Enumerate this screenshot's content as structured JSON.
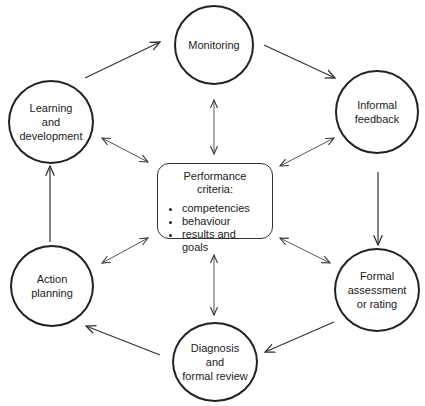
{
  "diagram": {
    "center": {
      "title": "Performance criteria:",
      "items": [
        "competencies",
        "behaviour",
        "results and goals"
      ]
    },
    "nodes": [
      {
        "id": "monitoring",
        "label": "Monitoring"
      },
      {
        "id": "informal-feedback",
        "label": "Informal\nfeedback"
      },
      {
        "id": "formal-assessment",
        "label": "Formal\nassessment\nor rating"
      },
      {
        "id": "diagnosis",
        "label": "Diagnosis\nand\nformal review"
      },
      {
        "id": "action-planning",
        "label": "Action\nplanning"
      },
      {
        "id": "learning-development",
        "label": "Learning\nand\ndevelopment"
      }
    ],
    "cycle_edges": [
      [
        "learning-development",
        "monitoring"
      ],
      [
        "monitoring",
        "informal-feedback"
      ],
      [
        "informal-feedback",
        "formal-assessment"
      ],
      [
        "formal-assessment",
        "diagnosis"
      ],
      [
        "diagnosis",
        "action-planning"
      ],
      [
        "action-planning",
        "learning-development"
      ]
    ],
    "bidirectional_edges": [
      [
        "center",
        "monitoring"
      ],
      [
        "center",
        "informal-feedback"
      ],
      [
        "center",
        "formal-assessment"
      ],
      [
        "center",
        "diagnosis"
      ],
      [
        "center",
        "action-planning"
      ],
      [
        "center",
        "learning-development"
      ]
    ]
  }
}
